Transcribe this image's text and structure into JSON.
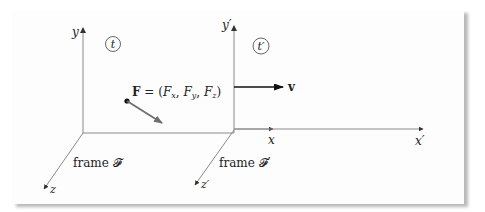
{
  "diagram": {
    "type": "reference-frames",
    "frame_left": {
      "name_label": "frame 𝓕",
      "time_label": "t",
      "axes": {
        "x": "x",
        "y": "y",
        "z": "z"
      }
    },
    "frame_right": {
      "name_label": "frame 𝓕′",
      "time_label": "t′",
      "axes": {
        "x": "x′",
        "y": "y′",
        "z": "z′"
      }
    },
    "force": {
      "label": "F = (F",
      "sub_x": "x",
      "sub_y": "y",
      "sub_z": "z",
      "full_text": "F = (Fx, Fy, Fz)"
    },
    "velocity": {
      "label": "v"
    },
    "colors": {
      "axis": "#8a8a8a",
      "force_arrow": "#6e6e6e",
      "velocity_arrow": "#111111",
      "text": "#222222",
      "shadow": "#b0b0b0"
    }
  }
}
